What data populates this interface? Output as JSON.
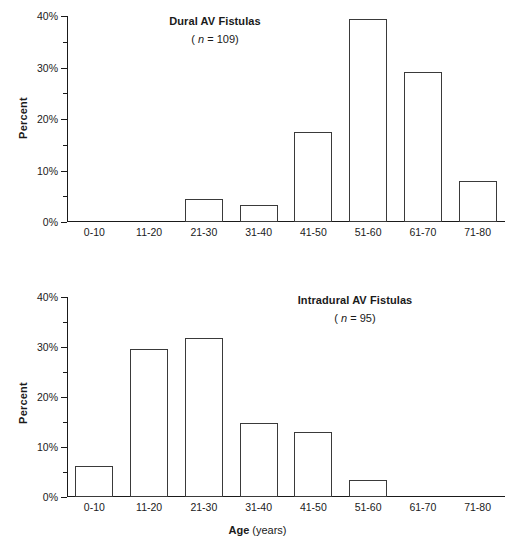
{
  "figure": {
    "background": "#ffffff",
    "ink": "#1a1a1a",
    "bar_stroke": "#3a3a3a",
    "bar_fill": "#ffffff"
  },
  "axis": {
    "y_title": "Percent",
    "y_ticks": [
      "0%",
      "10%",
      "20%",
      "30%",
      "40%"
    ],
    "x_title_strong": "Age",
    "x_title_rest": " (years)",
    "categories": [
      "0-10",
      "11-20",
      "21-30",
      "31-40",
      "41-50",
      "51-60",
      "61-70",
      "71-80"
    ]
  },
  "panels": [
    {
      "id": "top",
      "title": "Dural AV Fistulas",
      "n_open": "( ",
      "n_symbol": "n",
      "n_value": " = 109)",
      "values": [
        0,
        0,
        4.4,
        3.4,
        17.4,
        39.4,
        29.2,
        7.9
      ]
    },
    {
      "id": "bottom",
      "title": "Intradural AV Fistulas",
      "n_open": "( ",
      "n_symbol": "n",
      "n_value": " = 95)",
      "values": [
        6.3,
        29.7,
        31.8,
        14.9,
        13.1,
        3.4,
        0,
        0
      ]
    }
  ],
  "chart_data": [
    {
      "type": "bar",
      "title": "Dural AV Fistulas ( n = 109)",
      "subtitle": "( n = 109)",
      "xlabel": "Age (years)",
      "ylabel": "Percent",
      "categories": [
        "0-10",
        "11-20",
        "21-30",
        "31-40",
        "41-50",
        "51-60",
        "61-70",
        "71-80"
      ],
      "values": [
        0,
        0,
        4.4,
        3.4,
        17.4,
        39.4,
        29.2,
        7.9
      ],
      "ylim": [
        0,
        40
      ],
      "yticks": [
        0,
        10,
        20,
        30,
        40
      ],
      "ytick_labels": [
        "0%",
        "10%",
        "20%",
        "30%",
        "40%"
      ],
      "minor_tick_interval": 5,
      "grid": false,
      "legend": null,
      "n": 109
    },
    {
      "type": "bar",
      "title": "Intradural AV Fistulas ( n = 95)",
      "subtitle": "( n = 95)",
      "xlabel": "Age (years)",
      "ylabel": "Percent",
      "categories": [
        "0-10",
        "11-20",
        "21-30",
        "31-40",
        "41-50",
        "51-60",
        "61-70",
        "71-80"
      ],
      "values": [
        6.3,
        29.7,
        31.8,
        14.9,
        13.1,
        3.4,
        0,
        0
      ],
      "ylim": [
        0,
        40
      ],
      "yticks": [
        0,
        10,
        20,
        30,
        40
      ],
      "ytick_labels": [
        "0%",
        "10%",
        "20%",
        "30%",
        "40%"
      ],
      "minor_tick_interval": 5,
      "grid": false,
      "legend": null,
      "n": 95
    }
  ]
}
